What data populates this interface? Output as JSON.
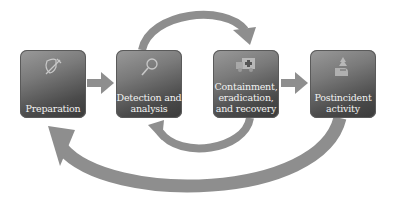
{
  "diagram": {
    "arrow_color": "#8e8e8e",
    "stages": [
      {
        "label": "Preparation",
        "icon": "shield-sword-icon"
      },
      {
        "label": "Detection and analysis",
        "icon": "magnifier-icon"
      },
      {
        "label": "Containment, eradication, and recovery",
        "icon": "ambulance-icon"
      },
      {
        "label": "Postincident activity",
        "icon": "road-tree-icon"
      }
    ],
    "arrows": [
      {
        "from": "Preparation",
        "to": "Detection and analysis"
      },
      {
        "from": "Detection and analysis",
        "to": "Containment, eradication, and recovery"
      },
      {
        "from": "Containment, eradication, and recovery",
        "to": "Detection and analysis"
      },
      {
        "from": "Containment, eradication, and recovery",
        "to": "Postincident activity"
      },
      {
        "from": "Postincident activity",
        "to": "Preparation"
      }
    ]
  }
}
